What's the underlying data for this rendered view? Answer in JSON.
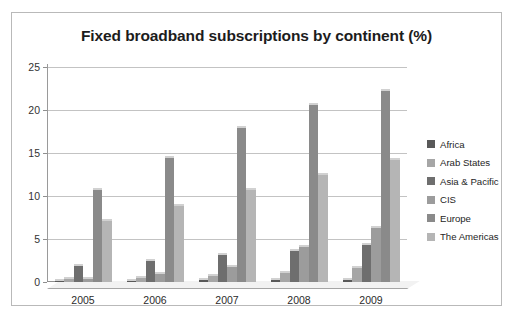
{
  "chart_data": {
    "type": "bar",
    "title": "Fixed broadband subscriptions by continent (%)",
    "xlabel": "",
    "ylabel": "",
    "categories": [
      "2005",
      "2006",
      "2007",
      "2008",
      "2009"
    ],
    "series": [
      {
        "name": "Africa",
        "color": "#595959",
        "values": [
          0.1,
          0.1,
          0.2,
          0.2,
          0.2
        ]
      },
      {
        "name": "Arab States",
        "color": "#a6a6a6",
        "values": [
          0.3,
          0.5,
          0.7,
          1.0,
          1.6
        ]
      },
      {
        "name": "Asia & Pacific",
        "color": "#6e6e6e",
        "values": [
          1.9,
          2.4,
          3.1,
          3.6,
          4.3
        ]
      },
      {
        "name": "CIS",
        "color": "#9c9c9c",
        "values": [
          0.3,
          0.9,
          1.8,
          4.1,
          6.3
        ]
      },
      {
        "name": "Europe",
        "color": "#8a8a8a",
        "values": [
          10.7,
          14.4,
          17.9,
          20.6,
          22.2
        ]
      },
      {
        "name": "The Americas",
        "color": "#b5b5b5",
        "values": [
          7.1,
          8.8,
          10.7,
          12.4,
          14.2
        ]
      }
    ],
    "yticks": [
      0,
      5,
      10,
      15,
      20,
      25
    ],
    "ylim": [
      0,
      25
    ],
    "grid": true,
    "legend_position": "right"
  },
  "legend": {
    "items": [
      {
        "label": "Africa"
      },
      {
        "label": "Arab States"
      },
      {
        "label": "Asia & Pacific"
      },
      {
        "label": "CIS"
      },
      {
        "label": "Europe"
      },
      {
        "label": "The Americas"
      }
    ]
  }
}
